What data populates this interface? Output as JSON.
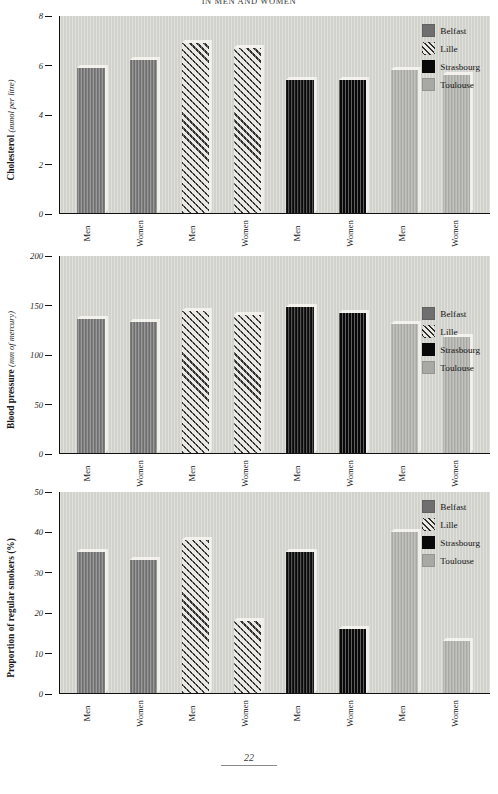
{
  "document": {
    "title_line": "IN MEN AND WOMEN",
    "folio": "22"
  },
  "legend": {
    "items": [
      {
        "label": "Belfast",
        "key": "belfast",
        "color": "#6f6f6f",
        "pattern": "solid-dark-grey"
      },
      {
        "label": "Lille",
        "key": "lille",
        "color": "#2e2e2e",
        "pattern": "diagonal-hatch"
      },
      {
        "label": "Strasbourg",
        "key": "strasbourg",
        "color": "#090909",
        "pattern": "solid-black"
      },
      {
        "label": "Toulouse",
        "key": "toulouse",
        "color": "#a8a8a4",
        "pattern": "solid-light-grey"
      }
    ]
  },
  "chart_data": [
    {
      "type": "bar",
      "id": "cholesterol",
      "title": "",
      "xlabel": "",
      "ylabel": "Cholesterol (mmol per litre)",
      "ylabel_plain": "Cholesterol",
      "ylabel_units": "(mmol per litre)",
      "ylim": [
        0,
        8
      ],
      "yticks": [
        0,
        2,
        4,
        6,
        8
      ],
      "ytick_labels": [
        "0",
        "2",
        "4",
        "6",
        "8"
      ],
      "grid": false,
      "legend_position": "top-right",
      "categories": [
        "Men",
        "Women",
        "Men",
        "Women",
        "Men",
        "Women",
        "Men",
        "Women"
      ],
      "groups": [
        "Belfast",
        "Belfast",
        "Lille",
        "Lille",
        "Strasbourg",
        "Strasbourg",
        "Toulouse",
        "Toulouse"
      ],
      "series": [
        {
          "name": "Belfast",
          "values": [
            5.9,
            6.2,
            null,
            null,
            null,
            null,
            null,
            null
          ]
        },
        {
          "name": "Lille",
          "values": [
            null,
            null,
            6.9,
            6.7,
            null,
            null,
            null,
            null
          ]
        },
        {
          "name": "Strasbourg",
          "values": [
            null,
            null,
            null,
            null,
            5.4,
            5.4,
            null,
            null
          ]
        },
        {
          "name": "Toulouse",
          "values": [
            null,
            null,
            null,
            null,
            null,
            null,
            5.8,
            5.6
          ]
        }
      ],
      "values": [
        5.9,
        6.2,
        6.9,
        6.7,
        5.4,
        5.4,
        5.8,
        5.6
      ]
    },
    {
      "type": "bar",
      "id": "bloodpressure",
      "title": "",
      "xlabel": "",
      "ylabel": "Blood pressure (mm of mercury)",
      "ylabel_plain": "Blood pressure",
      "ylabel_units": "(mm of mercury)",
      "ylim": [
        0,
        200
      ],
      "yticks": [
        0,
        50,
        100,
        150,
        200
      ],
      "ytick_labels": [
        "0",
        "50",
        "100",
        "150",
        "200"
      ],
      "grid": false,
      "legend_position": "middle-right",
      "categories": [
        "Men",
        "Women",
        "Men",
        "Women",
        "Men",
        "Women",
        "Men",
        "Women"
      ],
      "groups": [
        "Belfast",
        "Belfast",
        "Lille",
        "Lille",
        "Strasbourg",
        "Strasbourg",
        "Toulouse",
        "Toulouse"
      ],
      "series": [
        {
          "name": "Belfast",
          "values": [
            136,
            133,
            null,
            null,
            null,
            null,
            null,
            null
          ]
        },
        {
          "name": "Lille",
          "values": [
            null,
            null,
            144,
            140,
            null,
            null,
            null,
            null
          ]
        },
        {
          "name": "Strasbourg",
          "values": [
            null,
            null,
            null,
            null,
            148,
            142,
            null,
            null
          ]
        },
        {
          "name": "Toulouse",
          "values": [
            null,
            null,
            null,
            null,
            null,
            null,
            131,
            118
          ]
        }
      ],
      "values": [
        136,
        133,
        144,
        140,
        148,
        142,
        131,
        118
      ]
    },
    {
      "type": "bar",
      "id": "smokers",
      "title": "",
      "xlabel": "",
      "ylabel": "Proportion of regular smokers (%)",
      "ylabel_plain": "Proportion of regular smokers (%)",
      "ylabel_units": "",
      "ylim": [
        0,
        50
      ],
      "yticks": [
        0,
        10,
        20,
        30,
        40,
        50
      ],
      "ytick_labels": [
        "0",
        "10",
        "20",
        "30",
        "40",
        "50"
      ],
      "grid": false,
      "legend_position": "top-right",
      "categories": [
        "Men",
        "Women",
        "Men",
        "Women",
        "Men",
        "Women",
        "Men",
        "Women"
      ],
      "groups": [
        "Belfast",
        "Belfast",
        "Lille",
        "Lille",
        "Strasbourg",
        "Strasbourg",
        "Toulouse",
        "Toulouse"
      ],
      "series": [
        {
          "name": "Belfast",
          "values": [
            35,
            33,
            null,
            null,
            null,
            null,
            null,
            null
          ]
        },
        {
          "name": "Lille",
          "values": [
            null,
            null,
            38,
            18,
            null,
            null,
            null,
            null
          ]
        },
        {
          "name": "Strasbourg",
          "values": [
            null,
            null,
            null,
            null,
            35,
            16,
            null,
            null
          ]
        },
        {
          "name": "Toulouse",
          "values": [
            null,
            null,
            null,
            null,
            null,
            null,
            40,
            13
          ]
        }
      ],
      "values": [
        35,
        33,
        38,
        18,
        35,
        16,
        40,
        13
      ]
    }
  ]
}
